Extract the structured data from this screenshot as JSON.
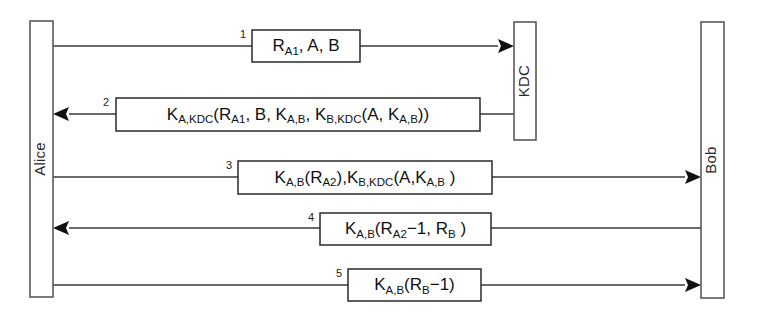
{
  "diagram": {
    "type": "sequence-diagram",
    "width": 767,
    "height": 315,
    "background_color": "#ffffff",
    "line_color": "#3a3a3a",
    "box_stroke_color": "#2a2a2a",
    "lifeline_stroke_color": "#5a5a5a"
  },
  "actors": [
    {
      "id": "alice",
      "label": "Alice",
      "x": 30,
      "y": 21,
      "width": 23,
      "height": 276,
      "label_rotation": -90
    },
    {
      "id": "kdc",
      "label": "KDC",
      "x": 514,
      "y": 22,
      "width": 22,
      "height": 118,
      "label_rotation": -90
    },
    {
      "id": "bob",
      "label": "Bob",
      "x": 701,
      "y": 22,
      "width": 23,
      "height": 276,
      "label_rotation": -90
    }
  ],
  "messages": [
    {
      "number": "1",
      "from": "alice",
      "to": "kdc",
      "direction": "right",
      "y": 46,
      "box_x": 252,
      "box_y": 30,
      "box_width": 108,
      "box_height": 32,
      "number_x": 243,
      "number_y": 34,
      "plain_text": "R_A1, A, B",
      "parts": [
        {
          "t": "R",
          "sub": false
        },
        {
          "t": "A1",
          "sub": true
        },
        {
          "t": ", A, B",
          "sub": false
        }
      ]
    },
    {
      "number": "2",
      "from": "kdc",
      "to": "alice",
      "direction": "left",
      "y": 114,
      "box_x": 116,
      "box_y": 98,
      "box_width": 364,
      "box_height": 33,
      "number_x": 106,
      "number_y": 102,
      "plain_text": "K_A,KDC(R_A1, B, K_A,B, K_B,KDC(A, K_A,B))",
      "parts": [
        {
          "t": "K",
          "sub": false
        },
        {
          "t": "A,KDC",
          "sub": true
        },
        {
          "t": "(R",
          "sub": false
        },
        {
          "t": "A1",
          "sub": true
        },
        {
          "t": ", B, K",
          "sub": false
        },
        {
          "t": "A,B",
          "sub": true
        },
        {
          "t": ", K",
          "sub": false
        },
        {
          "t": "B,KDC",
          "sub": true
        },
        {
          "t": "(A, K",
          "sub": false
        },
        {
          "t": "A,B",
          "sub": true
        },
        {
          "t": "))",
          "sub": false
        }
      ]
    },
    {
      "number": "3",
      "from": "alice",
      "to": "bob",
      "direction": "right",
      "y": 177,
      "box_x": 238,
      "box_y": 161,
      "box_width": 254,
      "box_height": 33,
      "number_x": 229,
      "number_y": 165,
      "plain_text": "K_A,B(R_A2), K_B,KDC(A, K_A,B)",
      "parts": [
        {
          "t": "K",
          "sub": false
        },
        {
          "t": "A,B",
          "sub": true
        },
        {
          "t": "(R",
          "sub": false
        },
        {
          "t": "A2",
          "sub": true
        },
        {
          "t": "),K",
          "sub": false
        },
        {
          "t": "B,KDC",
          "sub": true
        },
        {
          "t": "(A,K",
          "sub": false
        },
        {
          "t": "A,B",
          "sub": true
        },
        {
          "t": " )",
          "sub": false
        }
      ]
    },
    {
      "number": "4",
      "from": "bob",
      "to": "alice",
      "direction": "left",
      "y": 228,
      "box_x": 320,
      "box_y": 213,
      "box_width": 171,
      "box_height": 32,
      "number_x": 311,
      "number_y": 217,
      "plain_text": "K_A,B(R_A2−1, R_B)",
      "parts": [
        {
          "t": "K",
          "sub": false
        },
        {
          "t": "A,B",
          "sub": true
        },
        {
          "t": "(R",
          "sub": false
        },
        {
          "t": "A2",
          "sub": true
        },
        {
          "t": "−1, R",
          "sub": false
        },
        {
          "t": "B",
          "sub": true
        },
        {
          "t": " )",
          "sub": false
        }
      ]
    },
    {
      "number": "5",
      "from": "alice",
      "to": "bob",
      "direction": "right",
      "y": 285,
      "box_x": 348,
      "box_y": 269,
      "box_width": 133,
      "box_height": 32,
      "number_x": 339,
      "number_y": 273,
      "plain_text": "K_A,B(R_B−1)",
      "parts": [
        {
          "t": "K",
          "sub": false
        },
        {
          "t": "A,B",
          "sub": true
        },
        {
          "t": "(R",
          "sub": false
        },
        {
          "t": "B",
          "sub": true
        },
        {
          "t": "−1)",
          "sub": false
        }
      ]
    }
  ]
}
